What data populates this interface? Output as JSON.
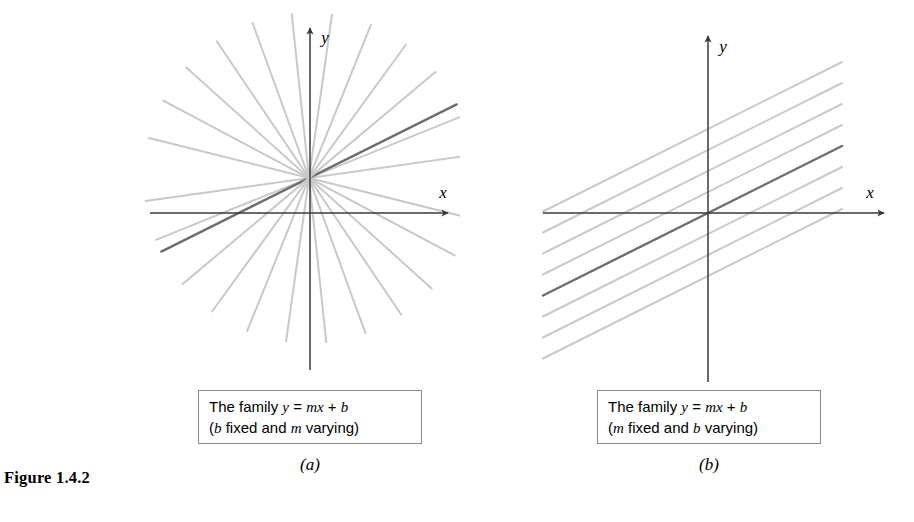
{
  "figure": {
    "number_label": "Figure 1.4.2",
    "axis_label_x": "x",
    "axis_label_y": "y",
    "line_color_light": "#c9c9c9",
    "line_color_highlight": "#6e6e6e",
    "axis_color": "#3a3a3a",
    "box_border_color": "#8a8a8a"
  },
  "panel_a": {
    "label": "(a)",
    "caption_line1_prefix": "The family ",
    "caption_line1_y": "y",
    "caption_line1_eq": " = ",
    "caption_line1_m": "m",
    "caption_line1_x": "x",
    "caption_line1_plus": " + ",
    "caption_line1_b": "b",
    "caption_line2_open": "(",
    "caption_line2_fixed_var": "b",
    "caption_line2_mid": " fixed and ",
    "caption_line2_varying_var": "m",
    "caption_line2_close": " varying)",
    "caption_text_full": "The family y = mx + b (b fixed and m varying)"
  },
  "panel_b": {
    "label": "(b)",
    "caption_line1_prefix": "The family ",
    "caption_line1_y": "y",
    "caption_line1_eq": " = ",
    "caption_line1_m": "m",
    "caption_line1_x": "x",
    "caption_line1_plus": " + ",
    "caption_line1_b": "b",
    "caption_line2_open": "(",
    "caption_line2_fixed_var": "m",
    "caption_line2_mid": " fixed and ",
    "caption_line2_varying_var": "b",
    "caption_line2_close": " varying)",
    "caption_text_full": "The family y = mx + b (m fixed and b varying)"
  },
  "chart_data": [
    {
      "type": "line",
      "title": "The family y = mx + b (b fixed and m varying)",
      "subtitle": "(a)",
      "description": "Pencil of concurrent lines through a common point; slope m varies, intercept b fixed",
      "xlabel": "x",
      "ylabel": "y",
      "grid": false,
      "legend": "none",
      "origin_px": [
        310,
        213
      ],
      "pencil_center_px": [
        309,
        178
      ],
      "axis_x_px": {
        "x1": 150,
        "x2": 448,
        "y": 213
      },
      "axis_y_px": {
        "x": 310,
        "y1": 28,
        "y2": 370
      },
      "line_length_px": 330,
      "slopes_deg": [
        8,
        22,
        36,
        50,
        64,
        78,
        92,
        106,
        120,
        134,
        148,
        162,
        172
      ],
      "highlight_slope_deg": 26.5,
      "highlight_slope_value": 0.5,
      "series": [
        {
          "name": "line-1",
          "angle_deg": 8,
          "highlight": false
        },
        {
          "name": "line-2",
          "angle_deg": 22,
          "highlight": false
        },
        {
          "name": "line-3",
          "angle_deg": 26.5,
          "highlight": true
        },
        {
          "name": "line-4",
          "angle_deg": 40,
          "highlight": false
        },
        {
          "name": "line-5",
          "angle_deg": 54,
          "highlight": false
        },
        {
          "name": "line-6",
          "angle_deg": 68,
          "highlight": false
        },
        {
          "name": "line-7",
          "angle_deg": 82,
          "highlight": false
        },
        {
          "name": "line-8",
          "angle_deg": 96,
          "highlight": false
        },
        {
          "name": "line-9",
          "angle_deg": 110,
          "highlight": false
        },
        {
          "name": "line-10",
          "angle_deg": 124,
          "highlight": false
        },
        {
          "name": "line-11",
          "angle_deg": 138,
          "highlight": false
        },
        {
          "name": "line-12",
          "angle_deg": 152,
          "highlight": false
        },
        {
          "name": "line-13",
          "angle_deg": 166,
          "highlight": false
        }
      ]
    },
    {
      "type": "line",
      "title": "The family y = mx + b (m fixed and b varying)",
      "subtitle": "(b)",
      "description": "Family of parallel lines with common slope; intercept b varies",
      "xlabel": "x",
      "ylabel": "y",
      "grid": false,
      "legend": "none",
      "origin_px": [
        708,
        213
      ],
      "axis_x_px": {
        "x1": 543,
        "x2": 884,
        "y": 213
      },
      "axis_y_px": {
        "x": 708,
        "y1": 36,
        "y2": 382
      },
      "slope_value": 0.5,
      "slope_deg": 26.5,
      "intercept_spacing_px": 21,
      "x_extent_px": {
        "x1": 543,
        "x2": 842
      },
      "series": [
        {
          "name": "line-1",
          "intercept_px": -63,
          "highlight": false
        },
        {
          "name": "line-2",
          "intercept_px": -42,
          "highlight": false
        },
        {
          "name": "line-3",
          "intercept_px": -21,
          "highlight": false
        },
        {
          "name": "line-4",
          "intercept_px": 0,
          "highlight": true
        },
        {
          "name": "line-5",
          "intercept_px": 21,
          "highlight": false
        },
        {
          "name": "line-6",
          "intercept_px": 42,
          "highlight": false
        },
        {
          "name": "line-7",
          "intercept_px": 63,
          "highlight": false
        },
        {
          "name": "line-8",
          "intercept_px": 84,
          "highlight": false
        }
      ]
    }
  ]
}
